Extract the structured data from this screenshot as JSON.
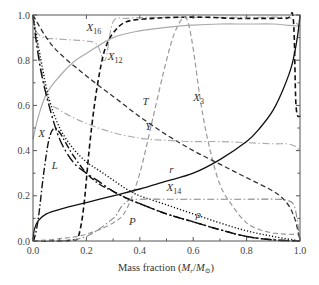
{
  "chart_data": {
    "type": "line",
    "title": "",
    "xlabel": "Mass fraction (M_r/M_⊙)",
    "xlabel_parts": {
      "prefix": "Mass fraction (",
      "m1": "M",
      "s1": "r",
      "slash": "/",
      "m2": "M",
      "s2": "⊙",
      "suffix": ")"
    },
    "ylabel": "",
    "xlim": [
      0,
      1
    ],
    "ylim": [
      0,
      1
    ],
    "grid": false,
    "legend": "inline labels",
    "x_ticks": [
      "0.0",
      "0.2",
      "0.4",
      "0.6",
      "0.8",
      "1.0"
    ],
    "y_ticks": [
      "0.0",
      "0.2",
      "0.4",
      "0.6",
      "0.8",
      "1.0"
    ],
    "series": [
      {
        "name": "X16",
        "label": "X",
        "sub": "16",
        "style": "dashdot",
        "color": "#aaaaaa",
        "width": 1.1,
        "x": [
          0.0,
          0.01,
          0.04,
          0.08,
          0.14,
          0.2,
          0.24,
          0.27,
          0.3,
          0.35,
          0.45,
          0.55,
          0.65,
          0.75,
          0.85,
          0.95,
          0.98,
          1.0
        ],
        "y": [
          0.99,
          0.93,
          0.9,
          0.895,
          0.89,
          0.885,
          0.87,
          0.8,
          0.97,
          0.985,
          0.99,
          0.99,
          0.99,
          0.99,
          0.99,
          0.99,
          0.97,
          0.95
        ],
        "label_pos": [
          0.2,
          0.93
        ]
      },
      {
        "name": "X12",
        "label": "X",
        "sub": "12",
        "style": "dashed",
        "color": "#111111",
        "width": 1.6,
        "x": [
          0.0,
          0.1,
          0.15,
          0.17,
          0.19,
          0.21,
          0.23,
          0.25,
          0.27,
          0.3,
          0.35,
          0.45,
          0.55,
          0.65,
          0.75,
          0.85,
          0.95,
          0.975,
          0.985,
          1.0
        ],
        "y": [
          0.0,
          0.0,
          0.005,
          0.02,
          0.15,
          0.4,
          0.6,
          0.75,
          0.85,
          0.92,
          0.97,
          0.985,
          0.99,
          0.99,
          0.985,
          0.985,
          0.985,
          0.98,
          0.6,
          0.55
        ],
        "label_pos": [
          0.28,
          0.8
        ]
      },
      {
        "name": "X3",
        "label": "X",
        "sub": "3",
        "style": "dashed",
        "color": "#999999",
        "width": 1.2,
        "x": [
          0.0,
          0.1,
          0.2,
          0.3,
          0.35,
          0.4,
          0.45,
          0.5,
          0.53,
          0.56,
          0.58,
          0.6,
          0.63,
          0.66,
          0.7,
          0.75,
          0.8,
          0.85,
          0.9,
          0.95,
          1.0
        ],
        "y": [
          0.0,
          0.01,
          0.03,
          0.08,
          0.14,
          0.3,
          0.55,
          0.8,
          0.92,
          0.985,
          0.97,
          0.85,
          0.6,
          0.42,
          0.25,
          0.15,
          0.08,
          0.05,
          0.035,
          0.03,
          0.03
        ],
        "label_pos": [
          0.6,
          0.62
        ]
      },
      {
        "name": "T",
        "label": "T",
        "style": "dashed",
        "color": "#333333",
        "width": 1.3,
        "x": [
          0.0,
          0.05,
          0.1,
          0.2,
          0.3,
          0.4,
          0.5,
          0.6,
          0.7,
          0.8,
          0.9,
          0.95,
          0.98,
          1.0
        ],
        "y": [
          1.0,
          0.9,
          0.83,
          0.73,
          0.64,
          0.55,
          0.47,
          0.4,
          0.34,
          0.28,
          0.22,
          0.17,
          0.1,
          0.0
        ],
        "label_pos": [
          0.41,
          0.6
        ]
      },
      {
        "name": "Y",
        "label": "Y",
        "style": "dashdot",
        "color": "#aaaaaa",
        "width": 1.1,
        "x": [
          0.0,
          0.05,
          0.1,
          0.2,
          0.3,
          0.4,
          0.5,
          0.6,
          0.7,
          0.8,
          0.9,
          0.95,
          0.98,
          1.0
        ],
        "y": [
          1.0,
          0.65,
          0.58,
          0.52,
          0.48,
          0.455,
          0.445,
          0.44,
          0.44,
          0.435,
          0.43,
          0.43,
          0.42,
          0.4
        ],
        "label_pos": [
          0.42,
          0.49
        ]
      },
      {
        "name": "X",
        "label": "X",
        "style": "solid",
        "color": "#aaaaaa",
        "width": 1.2,
        "x": [
          0.0,
          0.02,
          0.05,
          0.1,
          0.15,
          0.2,
          0.3,
          0.4,
          0.5,
          0.6,
          0.7,
          0.8,
          0.9,
          0.95,
          1.0
        ],
        "y": [
          0.45,
          0.55,
          0.65,
          0.73,
          0.79,
          0.83,
          0.9,
          0.93,
          0.945,
          0.955,
          0.96,
          0.96,
          0.96,
          0.955,
          0.95
        ],
        "label_pos": [
          0.02,
          0.46
        ]
      },
      {
        "name": "L",
        "label": "L",
        "style": "dashdot",
        "color": "#111111",
        "width": 1.4,
        "x": [
          0.0,
          0.005,
          0.02,
          0.04,
          0.06,
          0.08,
          0.1,
          0.12,
          0.15,
          0.2,
          0.25,
          0.3,
          0.35,
          0.4,
          0.5,
          0.6,
          0.7,
          0.8,
          0.9,
          1.0
        ],
        "y": [
          0.0,
          0.01,
          0.1,
          0.3,
          0.45,
          0.5,
          0.48,
          0.44,
          0.38,
          0.3,
          0.25,
          0.22,
          0.19,
          0.165,
          0.12,
          0.085,
          0.05,
          0.02,
          0.005,
          0.0
        ],
        "label_pos": [
          0.07,
          0.32
        ]
      },
      {
        "name": "P",
        "label": "P",
        "style": "longdashdot",
        "color": "#111111",
        "width": 1.4,
        "x": [
          0.0,
          0.01,
          0.03,
          0.06,
          0.1,
          0.15,
          0.2,
          0.25,
          0.3,
          0.35,
          0.4,
          0.5,
          0.6,
          0.7,
          0.8,
          0.9,
          1.0
        ],
        "y": [
          1.0,
          0.9,
          0.75,
          0.6,
          0.45,
          0.35,
          0.3,
          0.26,
          0.22,
          0.19,
          0.165,
          0.12,
          0.085,
          0.05,
          0.02,
          0.005,
          0.0
        ],
        "label_pos": [
          0.36,
          0.07
        ]
      },
      {
        "name": "rho",
        "label": "ρ",
        "style": "dotted",
        "color": "#111111",
        "width": 1.4,
        "x": [
          0.0,
          0.03,
          0.06,
          0.1,
          0.15,
          0.2,
          0.25,
          0.3,
          0.35,
          0.4,
          0.5,
          0.6,
          0.7,
          0.8,
          0.9,
          1.0
        ],
        "y": [
          1.0,
          0.8,
          0.63,
          0.5,
          0.41,
          0.35,
          0.31,
          0.27,
          0.23,
          0.2,
          0.16,
          0.12,
          0.08,
          0.045,
          0.02,
          0.0
        ],
        "label_pos": [
          0.61,
          0.1
        ]
      },
      {
        "name": "X14",
        "label": "X",
        "sub": "14",
        "style": "dashdot",
        "color": "#888888",
        "width": 1.1,
        "x": [
          0.0,
          0.1,
          0.2,
          0.3,
          0.33,
          0.36,
          0.4,
          0.5,
          0.6,
          0.7,
          0.8,
          0.9,
          0.95,
          0.98,
          1.0
        ],
        "y": [
          0.0,
          0.0,
          0.02,
          0.1,
          0.15,
          0.18,
          0.185,
          0.185,
          0.185,
          0.185,
          0.185,
          0.185,
          0.18,
          0.15,
          0.0
        ],
        "label_pos": [
          0.5,
          0.22
        ]
      },
      {
        "name": "r",
        "label": "r",
        "style": "solid",
        "color": "#111111",
        "width": 1.3,
        "x": [
          0.0,
          0.005,
          0.02,
          0.05,
          0.1,
          0.2,
          0.3,
          0.4,
          0.5,
          0.6,
          0.7,
          0.8,
          0.85,
          0.9,
          0.94,
          0.97,
          0.99,
          1.0
        ],
        "y": [
          0.0,
          0.05,
          0.09,
          0.12,
          0.14,
          0.17,
          0.2,
          0.23,
          0.265,
          0.3,
          0.36,
          0.44,
          0.5,
          0.58,
          0.68,
          0.78,
          0.9,
          1.0
        ],
        "label_pos": [
          0.51,
          0.3
        ]
      }
    ]
  }
}
